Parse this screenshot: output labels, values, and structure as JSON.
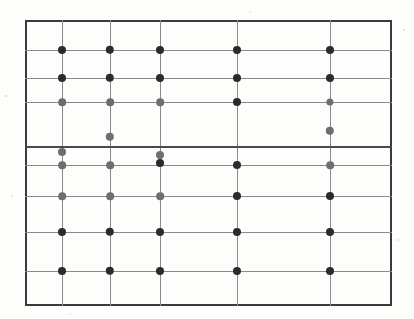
{
  "figure": {
    "kind": "scanned-scatter-grid",
    "caption": "",
    "background_color": "#fdfdfc",
    "frame": {
      "x": 25,
      "y": 20,
      "width": 367,
      "height": 286,
      "border_color": "#3a3a3a",
      "border_width": 2
    }
  },
  "chart_data": {
    "type": "scatter",
    "title": "",
    "subtitle": "",
    "xlabel": "",
    "ylabel": "",
    "xlim": [
      25,
      392
    ],
    "ylim": [
      306,
      20
    ],
    "grid": true,
    "legend": "none",
    "annotations": [],
    "xticklabels": [],
    "yticklabels": [],
    "gridlines": {
      "vertical_x": [
        62,
        110,
        160,
        237,
        330
      ],
      "horizontal_y": [
        50,
        78,
        102,
        146,
        165,
        196,
        232,
        271
      ],
      "emphasis_horizontal_y": [
        146
      ],
      "color": "#8a8a8a",
      "emphasis_color": "#4a4a4a"
    },
    "marker_colors": {
      "dark": "#2b2b2b",
      "mid": "#5e5e5e",
      "light": "#8d8d8d"
    },
    "series": [
      {
        "name": "dark markers",
        "color": "#2b2b2b",
        "marker": "circle",
        "points": [
          {
            "x": 62,
            "y": 50,
            "r": 4.0
          },
          {
            "x": 110,
            "y": 50,
            "r": 4.2
          },
          {
            "x": 160,
            "y": 50,
            "r": 4.0
          },
          {
            "x": 237,
            "y": 50,
            "r": 4.0
          },
          {
            "x": 330,
            "y": 50,
            "r": 4.0
          },
          {
            "x": 62,
            "y": 78,
            "r": 4.0
          },
          {
            "x": 110,
            "y": 78,
            "r": 4.2
          },
          {
            "x": 160,
            "y": 78,
            "r": 4.0
          },
          {
            "x": 237,
            "y": 78,
            "r": 4.0
          },
          {
            "x": 330,
            "y": 78,
            "r": 4.0
          },
          {
            "x": 237,
            "y": 102,
            "r": 4.0
          },
          {
            "x": 237,
            "y": 165,
            "r": 4.0
          },
          {
            "x": 160,
            "y": 163,
            "r": 4.0
          },
          {
            "x": 237,
            "y": 196,
            "r": 4.0
          },
          {
            "x": 330,
            "y": 196,
            "r": 4.0
          },
          {
            "x": 62,
            "y": 232,
            "r": 4.0
          },
          {
            "x": 110,
            "y": 232,
            "r": 4.2
          },
          {
            "x": 160,
            "y": 232,
            "r": 4.0
          },
          {
            "x": 237,
            "y": 232,
            "r": 4.0
          },
          {
            "x": 330,
            "y": 232,
            "r": 4.0
          },
          {
            "x": 62,
            "y": 271,
            "r": 4.0
          },
          {
            "x": 110,
            "y": 271,
            "r": 4.2
          },
          {
            "x": 160,
            "y": 271,
            "r": 4.0
          },
          {
            "x": 237,
            "y": 271,
            "r": 4.0
          },
          {
            "x": 330,
            "y": 271,
            "r": 4.0
          }
        ]
      },
      {
        "name": "grey markers",
        "color": "#6e6e6e",
        "marker": "circle",
        "points": [
          {
            "x": 62,
            "y": 102,
            "r": 3.8
          },
          {
            "x": 110,
            "y": 102,
            "r": 3.8
          },
          {
            "x": 160,
            "y": 102,
            "r": 3.8
          },
          {
            "x": 330,
            "y": 102,
            "r": 3.6
          },
          {
            "x": 110,
            "y": 137,
            "r": 4.2
          },
          {
            "x": 330,
            "y": 131,
            "r": 4.2
          },
          {
            "x": 62,
            "y": 152,
            "r": 4.0
          },
          {
            "x": 160,
            "y": 155,
            "r": 4.0
          },
          {
            "x": 62,
            "y": 165,
            "r": 3.8
          },
          {
            "x": 110,
            "y": 165,
            "r": 3.8
          },
          {
            "x": 330,
            "y": 165,
            "r": 3.8
          },
          {
            "x": 62,
            "y": 196,
            "r": 3.8
          },
          {
            "x": 110,
            "y": 196,
            "r": 3.8
          },
          {
            "x": 160,
            "y": 196,
            "r": 3.8
          }
        ]
      }
    ]
  }
}
